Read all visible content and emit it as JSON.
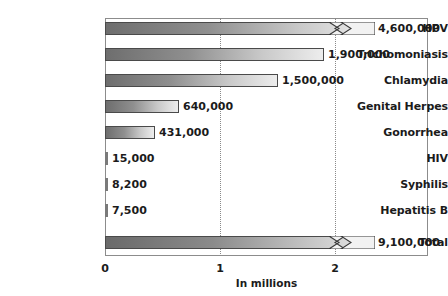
{
  "chart_data": {
    "type": "bar",
    "orientation": "horizontal",
    "title": "",
    "xlabel": "In millions",
    "ylabel": "",
    "xlim": [
      0,
      2.8
    ],
    "xticks": [
      0,
      1,
      2
    ],
    "xtick_labels": [
      "0",
      "1",
      "2"
    ],
    "grid": "vertical-dotted",
    "legend": "none",
    "units": "millions",
    "categories": [
      "HPV",
      "Trichomoniasis",
      "Chlamydia",
      "Genital Herpes",
      "Gonorrhea",
      "HIV",
      "Syphilis",
      "Hepatitis B",
      "Total"
    ],
    "values": [
      4600000,
      1900000,
      1500000,
      640000,
      431000,
      15000,
      8200,
      7500,
      9100000
    ],
    "value_labels": [
      "4,600,000",
      "1,900,000",
      "1,500,000",
      "640,000",
      "431,000",
      "15,000",
      "8,200",
      "7,500",
      "9,100,000"
    ],
    "axis_broken_bars": [
      "HPV",
      "Total"
    ]
  },
  "bars": [
    {
      "label": "HPV",
      "value_label": "4,600,000",
      "y": 22,
      "width": 270,
      "broken": true,
      "tiny": false,
      "label_x": 378,
      "label_y": 22
    },
    {
      "label": "Trichomoniasis",
      "value_label": "1,900,000",
      "y": 48,
      "width": 219,
      "broken": false,
      "tiny": false,
      "label_x": 328,
      "label_y": 48
    },
    {
      "label": "Chlamydia",
      "value_label": "1,500,000",
      "y": 74,
      "width": 173,
      "broken": false,
      "tiny": false,
      "label_x": 282,
      "label_y": 74
    },
    {
      "label": "Genital Herpes",
      "value_label": "640,000",
      "y": 100,
      "width": 74,
      "broken": false,
      "tiny": false,
      "label_x": 183,
      "label_y": 100
    },
    {
      "label": "Gonorrhea",
      "value_label": "431,000",
      "y": 126,
      "width": 50,
      "broken": false,
      "tiny": false,
      "label_x": 159,
      "label_y": 126
    },
    {
      "label": "HIV",
      "value_label": "15,000",
      "y": 152,
      "width": 3,
      "broken": false,
      "tiny": true,
      "label_x": 112,
      "label_y": 152
    },
    {
      "label": "Syphilis",
      "value_label": "8,200",
      "y": 178,
      "width": 3,
      "broken": false,
      "tiny": true,
      "label_x": 112,
      "label_y": 178
    },
    {
      "label": "Hepatitis B",
      "value_label": "7,500",
      "y": 204,
      "width": 3,
      "broken": false,
      "tiny": true,
      "label_x": 112,
      "label_y": 204
    },
    {
      "label": "Total",
      "value_label": "9,100,000",
      "y": 236,
      "width": 270,
      "broken": true,
      "tiny": false,
      "label_x": 378,
      "label_y": 236
    }
  ],
  "category_labels": [
    {
      "text": "HPV",
      "y": 22
    },
    {
      "text": "Trichomoniasis",
      "y": 48
    },
    {
      "text": "Chlamydia",
      "y": 74
    },
    {
      "text": "Genital Herpes",
      "y": 100
    },
    {
      "text": "Gonorrhea",
      "y": 126
    },
    {
      "text": "HIV",
      "y": 152
    },
    {
      "text": "Syphilis",
      "y": 178
    },
    {
      "text": "Hepatitis B",
      "y": 204
    },
    {
      "text": "Total",
      "y": 236
    }
  ],
  "axis": {
    "title": "In millions",
    "ticks": [
      {
        "label": "0",
        "x": 105
      },
      {
        "label": "1",
        "x": 220
      },
      {
        "label": "2",
        "x": 335
      }
    ],
    "gridlines_x": [
      220,
      335
    ]
  },
  "colors": {
    "bar_gradient_start": "#6e6e6e",
    "bar_gradient_end": "#ededed",
    "bar_border": "#4a4a4a",
    "frame": "#8c8c8c",
    "gridline": "#8a8a8a",
    "text": "#1b1b1b",
    "background": "#ffffff"
  }
}
